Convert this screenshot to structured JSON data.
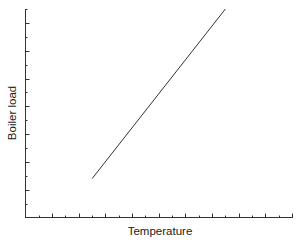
{
  "chart_data": {
    "type": "line",
    "title": "",
    "xlabel": "Temperature",
    "ylabel": "Boiler load",
    "x_tick_labels": [],
    "y_tick_labels": [],
    "grid": false,
    "legend": null,
    "xlim": [
      0,
      20
    ],
    "ylim": [
      0,
      15
    ],
    "series": [
      {
        "name": "Boiler load vs Temperature",
        "x": [
          5,
          15
        ],
        "y": [
          2.8,
          15
        ],
        "color": "#333333"
      }
    ]
  }
}
